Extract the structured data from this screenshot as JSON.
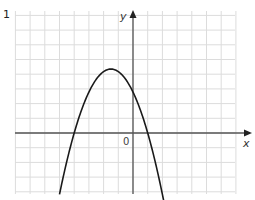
{
  "question": {
    "number": "1"
  },
  "axes": {
    "x_label": "x",
    "y_label": "y",
    "origin_label": "0"
  },
  "colors": {
    "grid": "#d8d8d8",
    "axis": "#555555",
    "curve": "#1a1a1a"
  },
  "chart_data": {
    "type": "line",
    "title": "",
    "xlabel": "x",
    "ylabel": "y",
    "grid": true,
    "legend": null,
    "xlim": [
      -8,
      7
    ],
    "ylim": [
      -4.2,
      8.3
    ],
    "series": [
      {
        "name": "parabola",
        "x": [
          -5.0,
          -4.5,
          -4.0,
          -3.5,
          -3.0,
          -2.5,
          -2.0,
          -1.5,
          -1.0,
          -0.5,
          0.0,
          0.5,
          1.0,
          1.5,
          2.2
        ],
        "y": [
          -4.2,
          -1.9,
          0.0,
          1.6,
          2.8,
          3.7,
          4.2,
          4.35,
          4.2,
          3.7,
          2.8,
          1.6,
          0.0,
          -1.9,
          -4.2
        ]
      }
    ],
    "annotations": [
      "roots at x=-4 and x=1 (grid units)"
    ]
  }
}
